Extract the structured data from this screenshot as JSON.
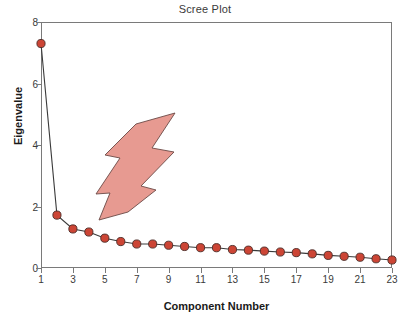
{
  "chart_data": {
    "type": "line",
    "title": "Scree Plot",
    "xlabel": "Component Number",
    "ylabel": "Eigenvalue",
    "x": [
      1,
      2,
      3,
      4,
      5,
      6,
      7,
      8,
      9,
      10,
      11,
      12,
      13,
      14,
      15,
      16,
      17,
      18,
      19,
      20,
      21,
      22,
      23
    ],
    "values": [
      7.3,
      1.72,
      1.27,
      1.17,
      0.97,
      0.86,
      0.78,
      0.78,
      0.74,
      0.7,
      0.66,
      0.66,
      0.6,
      0.58,
      0.55,
      0.52,
      0.5,
      0.46,
      0.41,
      0.38,
      0.35,
      0.3,
      0.26
    ],
    "xlim": [
      1,
      23
    ],
    "ylim": [
      0,
      8
    ],
    "ytick_labels": [
      "0",
      "2",
      "4",
      "6",
      "8"
    ],
    "ytick_values": [
      0,
      2,
      4,
      6,
      8
    ],
    "xtick_labels": [
      "1",
      "3",
      "5",
      "7",
      "9",
      "11",
      "13",
      "15",
      "17",
      "19",
      "21",
      "23"
    ],
    "xtick_values": [
      1,
      3,
      5,
      7,
      9,
      11,
      13,
      15,
      17,
      19,
      21,
      23
    ],
    "grid": false,
    "legend": "none",
    "series_name": "Eigenvalue",
    "marker": "circle",
    "marker_color": "#cc4535",
    "marker_edge_color": "#4a2a26",
    "line_color": "#3a3a3a",
    "frame_color": "#7a7a7a",
    "annotations": [
      {
        "name": "lightning-bolt-arrow",
        "shape": "lightning-bolt",
        "fill": "#e79a91",
        "stroke": "#6b4a46",
        "points_at_component": 4,
        "tip_x": 4.1,
        "tip_y": 1.42
      }
    ]
  }
}
